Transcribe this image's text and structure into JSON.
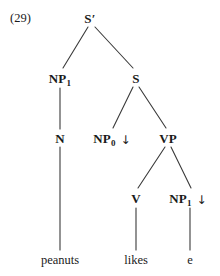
{
  "figure": {
    "example_number": "(29)",
    "width": 220,
    "height": 276,
    "background_color": "#ffffff",
    "line_color": "#3a3a3a",
    "text_color": "#1a1a1a",
    "type": "syntax-tree"
  },
  "nodes": {
    "s_bar": {
      "label": "S",
      "prime": "′",
      "subscript": "",
      "arrow": "",
      "x": 90,
      "y": 18
    },
    "np1_left": {
      "label": "NP",
      "prime": "",
      "subscript": "1",
      "arrow": "",
      "x": 60,
      "y": 78
    },
    "s": {
      "label": "S",
      "prime": "",
      "subscript": "",
      "arrow": "",
      "x": 136,
      "y": 78
    },
    "n": {
      "label": "N",
      "prime": "",
      "subscript": "",
      "arrow": "",
      "x": 60,
      "y": 138
    },
    "np0": {
      "label": "NP",
      "prime": "",
      "subscript": "0",
      "arrow": "↓",
      "x": 112,
      "y": 138
    },
    "vp": {
      "label": "VP",
      "prime": "",
      "subscript": "",
      "arrow": "",
      "x": 168,
      "y": 138
    },
    "v": {
      "label": "V",
      "prime": "",
      "subscript": "",
      "arrow": "",
      "x": 136,
      "y": 198
    },
    "np1_object": {
      "label": "NP",
      "prime": "",
      "subscript": "1",
      "arrow": "↓",
      "x": 188,
      "y": 198
    }
  },
  "terminals": {
    "peanuts": {
      "text": "peanuts",
      "x": 60,
      "y": 260
    },
    "likes": {
      "text": "likes",
      "x": 136,
      "y": 260
    },
    "trace": {
      "text": "e",
      "x": 190,
      "y": 260
    }
  },
  "edges": [
    {
      "name": "sbar-to-np1",
      "x1": 88,
      "y1": 27,
      "x2": 63,
      "y2": 68
    },
    {
      "name": "sbar-to-s",
      "x1": 95,
      "y1": 27,
      "x2": 133,
      "y2": 68
    },
    {
      "name": "np1-to-n",
      "x1": 60,
      "y1": 88,
      "x2": 60,
      "y2": 129
    },
    {
      "name": "s-to-np0",
      "x1": 133,
      "y1": 87,
      "x2": 113,
      "y2": 128
    },
    {
      "name": "s-to-vp",
      "x1": 139,
      "y1": 87,
      "x2": 166,
      "y2": 128
    },
    {
      "name": "n-to-peanuts",
      "x1": 60,
      "y1": 147,
      "x2": 60,
      "y2": 250
    },
    {
      "name": "vp-to-v",
      "x1": 165,
      "y1": 147,
      "x2": 138,
      "y2": 188
    },
    {
      "name": "vp-to-np1",
      "x1": 171,
      "y1": 147,
      "x2": 191,
      "y2": 188
    },
    {
      "name": "v-to-likes",
      "x1": 136,
      "y1": 208,
      "x2": 136,
      "y2": 250
    },
    {
      "name": "np1-to-trace",
      "x1": 190,
      "y1": 208,
      "x2": 190,
      "y2": 250
    }
  ]
}
